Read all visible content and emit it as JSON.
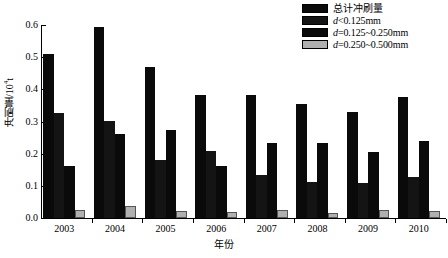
{
  "chart_data": {
    "type": "bar",
    "title": "",
    "xlabel": "年份",
    "ylabel": "冲刷量/10⁴t",
    "ylabel_base": "冲刷量/10",
    "ylabel_exp": "4",
    "ylabel_unit": "t",
    "categories": [
      "2003",
      "2004",
      "2005",
      "2006",
      "2007",
      "2008",
      "2009",
      "2010"
    ],
    "ylim": [
      0.0,
      0.6
    ],
    "yticks": [
      "0.0",
      "0.1",
      "0.2",
      "0.3",
      "0.4",
      "0.5",
      "0.6"
    ],
    "ytick_values": [
      0.0,
      0.1,
      0.2,
      0.3,
      0.4,
      0.5,
      0.6
    ],
    "grid": false,
    "legend_position": "top-right",
    "series": [
      {
        "name": "总计冲刷量",
        "color": "#0a0a0a",
        "values": [
          0.51,
          0.595,
          0.47,
          0.383,
          0.383,
          0.353,
          0.329,
          0.376
        ]
      },
      {
        "name": "d<0.125mm",
        "color": "#141414",
        "values": [
          0.325,
          0.302,
          0.181,
          0.207,
          0.133,
          0.113,
          0.109,
          0.126
        ]
      },
      {
        "name": "d=0.125~0.250mm",
        "color": "#0a0a0a",
        "values": [
          0.161,
          0.262,
          0.273,
          0.163,
          0.233,
          0.234,
          0.204,
          0.24
        ]
      },
      {
        "name": "d=0.250~0.500mm",
        "color": "#b0b0b0",
        "values": [
          0.026,
          0.038,
          0.022,
          0.019,
          0.025,
          0.014,
          0.025,
          0.022
        ]
      }
    ]
  },
  "legend": {
    "items": [
      {
        "label": "总计冲刷量",
        "italic_prefix": "",
        "color": "#0a0a0a"
      },
      {
        "label": "<0.125mm",
        "italic_prefix": "d",
        "color": "#141414"
      },
      {
        "label": "=0.125~0.250mm",
        "italic_prefix": "d",
        "color": "#0a0a0a"
      },
      {
        "label": "=0.250~0.500mm",
        "italic_prefix": "d",
        "color": "#b0b0b0"
      }
    ]
  }
}
